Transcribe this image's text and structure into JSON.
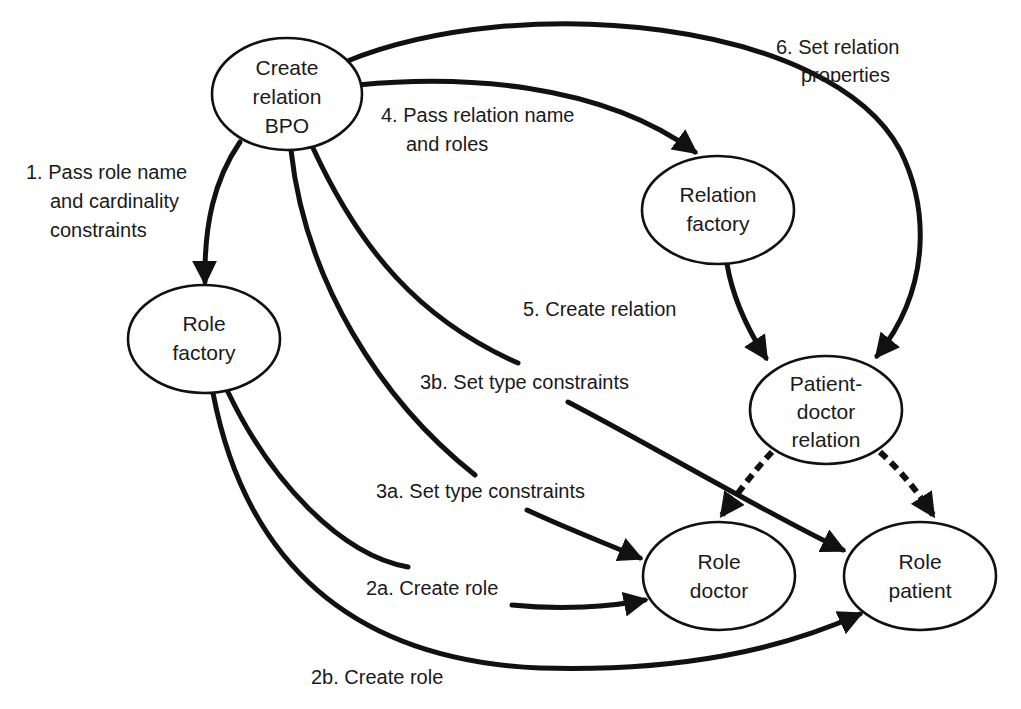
{
  "diagram": {
    "nodes": {
      "bpo": {
        "lines": [
          "Create",
          "relation",
          "BPO"
        ]
      },
      "relation_factory": {
        "lines": [
          "Relation",
          "factory"
        ]
      },
      "role_factory": {
        "lines": [
          "Role",
          "factory"
        ]
      },
      "patient_doctor_relation": {
        "lines": [
          "Patient-",
          "doctor",
          "relation"
        ]
      },
      "role_doctor": {
        "lines": [
          "Role",
          "doctor"
        ]
      },
      "role_patient": {
        "lines": [
          "Role",
          "patient"
        ]
      }
    },
    "edges": {
      "e1": {
        "from": "Create relation BPO",
        "to": "Role factory",
        "style": "solid",
        "lines": [
          "1. Pass role name",
          "and cardinality",
          "constraints"
        ]
      },
      "e2a": {
        "from": "Role factory",
        "to": "Role doctor",
        "style": "solid",
        "lines": [
          "2a. Create role"
        ]
      },
      "e2b": {
        "from": "Role factory",
        "to": "Role patient",
        "style": "solid",
        "lines": [
          "2b. Create role"
        ]
      },
      "e3a": {
        "from": "Create relation BPO",
        "to": "Role doctor",
        "style": "solid",
        "lines": [
          "3a. Set type constraints"
        ]
      },
      "e3b": {
        "from": "Create relation BPO",
        "to": "Role patient",
        "style": "solid",
        "lines": [
          "3b. Set type constraints"
        ]
      },
      "e4": {
        "from": "Create relation BPO",
        "to": "Relation factory",
        "style": "solid",
        "lines": [
          "4. Pass relation name",
          "and roles"
        ]
      },
      "e5": {
        "from": "Relation factory",
        "to": "Patient-doctor relation",
        "style": "solid",
        "lines": [
          "5. Create relation"
        ]
      },
      "e6": {
        "from": "Create relation BPO",
        "to": "Patient-doctor relation",
        "style": "solid",
        "lines": [
          "6. Set relation",
          "properties"
        ]
      },
      "d1": {
        "from": "Patient-doctor relation",
        "to": "Role doctor",
        "style": "dashed",
        "lines": []
      },
      "d2": {
        "from": "Patient-doctor relation",
        "to": "Role patient",
        "style": "dashed",
        "lines": []
      }
    },
    "colors": {
      "stroke": "#111111",
      "text": "#1a1a1a",
      "background": "#ffffff"
    }
  }
}
